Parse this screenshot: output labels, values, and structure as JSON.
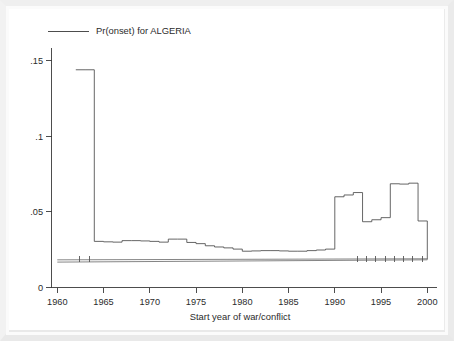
{
  "figure": {
    "background_color": "#ffffff",
    "ink_color": "#3a3a3a",
    "series_color": "#4a4a4a"
  },
  "legend": {
    "position": "top-left",
    "entries": [
      {
        "label": "Pr(onset) for ALGERIA",
        "marker": "line",
        "color": "#3a3a3a"
      }
    ]
  },
  "chart_data": {
    "type": "line",
    "title": "",
    "subtitle": "",
    "xlabel": "Start year of war/conflict",
    "ylabel": "",
    "xlim": [
      1959.0,
      2000.6
    ],
    "ylim": [
      0,
      0.158
    ],
    "grid": false,
    "legend_position": "top-left",
    "xticks": [
      1960,
      1965,
      1970,
      1975,
      1980,
      1985,
      1990,
      1995,
      2000
    ],
    "xtick_labels": [
      "1960",
      "1965",
      "1970",
      "1975",
      "1980",
      "1985",
      "1990",
      "1995",
      "2000"
    ],
    "yticks": [
      0,
      0.05,
      0.1,
      0.15
    ],
    "ytick_labels": [
      "0",
      ".05",
      ".1",
      ".15"
    ],
    "series": [
      {
        "name": "Pr(onset) for ALGERIA",
        "style": "step",
        "color": "#4a4a4a",
        "x": [
          1962,
          1963,
          1964,
          1965,
          1966,
          1967,
          1968,
          1969,
          1970,
          1971,
          1972,
          1973,
          1974,
          1975,
          1976,
          1977,
          1978,
          1979,
          1980,
          1981,
          1982,
          1983,
          1984,
          1985,
          1986,
          1987,
          1988,
          1989,
          1990,
          1991,
          1992,
          1993,
          1994,
          1995,
          1996,
          1997,
          1998,
          1999
        ],
        "values": [
          0.144,
          0.144,
          0.0305,
          0.0302,
          0.03,
          0.031,
          0.031,
          0.0308,
          0.0305,
          0.03,
          0.032,
          0.032,
          0.0298,
          0.029,
          0.0276,
          0.0268,
          0.0262,
          0.0254,
          0.024,
          0.0242,
          0.0244,
          0.0244,
          0.0242,
          0.024,
          0.024,
          0.0244,
          0.0248,
          0.0254,
          0.06,
          0.0612,
          0.0628,
          0.0435,
          0.0448,
          0.0462,
          0.0686,
          0.0684,
          0.069,
          0.044
        ]
      },
      {
        "name": "baseline-upper",
        "style": "line",
        "color": "#666666",
        "x": [
          1960.0,
          2000.0
        ],
        "values": [
          0.0183,
          0.019
        ]
      },
      {
        "name": "baseline-lower",
        "style": "line",
        "color": "#666666",
        "x": [
          1960.0,
          2000.0
        ],
        "values": [
          0.0168,
          0.0183
        ]
      }
    ],
    "rug": {
      "name": "war-onset-years",
      "y": 0.0185,
      "x": [
        1962,
        1963,
        1992,
        1993,
        1994,
        1995,
        1996,
        1997,
        1998,
        1999
      ]
    }
  }
}
